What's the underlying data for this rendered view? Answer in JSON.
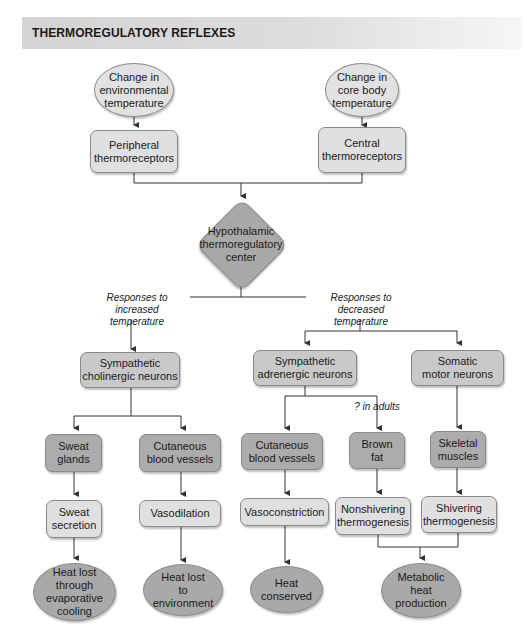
{
  "title": "THERMOREGULATORY REFLEXES",
  "colors": {
    "title_bar": "#d4d4d4",
    "light_fill": "#e0e0e0",
    "mid_fill": "#c9c9c9",
    "dark_fill": "#a9a9a9",
    "line": "#333333"
  },
  "inputs": {
    "environmental": "Change in\nenvironmental\ntemperature",
    "core": "Change in\ncore body\ntemperature"
  },
  "receptors": {
    "peripheral": "Peripheral\nthermoreceptors",
    "central": "Central\nthermoreceptors"
  },
  "center": "Hypothalamic\nthermoregulatory\ncenter",
  "branch_labels": {
    "increased": "Responses to increased\ntemperature",
    "decreased": "Responses to decreased\ntemperature",
    "brown_fat_note": "? in adults"
  },
  "neurons": {
    "cholinergic": "Sympathetic\ncholinergic neurons",
    "adrenergic": "Sympathetic\nadrenergic neurons",
    "somatic": "Somatic\nmotor neurons"
  },
  "effectors": {
    "sweat_glands": "Sweat\nglands",
    "cutaneous_dilate": "Cutaneous\nblood vessels",
    "cutaneous_constrict": "Cutaneous\nblood vessels",
    "brown_fat": "Brown\nfat",
    "skeletal_muscles": "Skeletal\nmuscles"
  },
  "responses": {
    "sweat_secretion": "Sweat\nsecretion",
    "vasodilation": "Vasodilation",
    "vasoconstriction": "Vasoconstriction",
    "nonshivering": "Nonshivering\nthermogenesis",
    "shivering": "Shivering\nthermogenesis"
  },
  "outcomes": {
    "evaporative": "Heat lost\nthrough\nevaporative\ncooling",
    "environment": "Heat lost\nto\nenvironment",
    "conserved": "Heat\nconserved",
    "metabolic": "Metabolic\nheat\nproduction"
  }
}
